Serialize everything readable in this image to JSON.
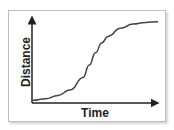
{
  "chart_data": {
    "type": "line",
    "title": "",
    "xlabel": "Time",
    "ylabel": "Distance",
    "grid": false,
    "legend": null,
    "curve_shape": "sigmoid (S-curve)",
    "x": [
      0,
      0.1,
      0.2,
      0.3,
      0.4,
      0.45,
      0.5,
      0.55,
      0.6,
      0.7,
      0.8,
      0.9,
      1.0
    ],
    "series": [
      {
        "name": "distance",
        "values": [
          0.02,
          0.04,
          0.08,
          0.15,
          0.3,
          0.45,
          0.6,
          0.72,
          0.8,
          0.9,
          0.95,
          0.97,
          0.98
        ]
      }
    ],
    "xlim": [
      0,
      1
    ],
    "ylim": [
      0,
      1
    ],
    "colors": {
      "line": "#444444",
      "axes": "#222222"
    }
  },
  "labels": {
    "x_axis": "Time",
    "y_axis": "Distance"
  }
}
